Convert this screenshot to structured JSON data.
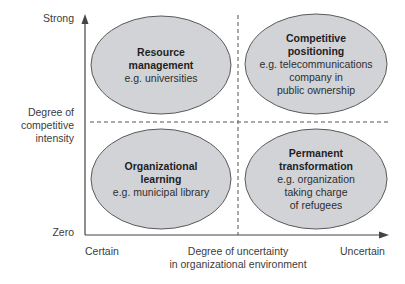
{
  "diagram": {
    "y_axis": {
      "title_lines": [
        "Degree of",
        "competitive",
        "intensity"
      ],
      "top_label": "Strong",
      "bottom_label": "Zero"
    },
    "x_axis": {
      "title_lines": [
        "Degree of uncertainty",
        "in organizational environment"
      ],
      "left_label": "Certain",
      "right_label": "Uncertain"
    },
    "quadrants": [
      {
        "position": "top-left",
        "title_lines": [
          "Resource",
          "management"
        ],
        "example_lines": [
          "e.g. universities"
        ]
      },
      {
        "position": "top-right",
        "title_lines": [
          "Competitive",
          "positioning"
        ],
        "example_lines": [
          "e.g. telecommunications",
          "company in",
          "public ownership"
        ]
      },
      {
        "position": "bottom-left",
        "title_lines": [
          "Organizational",
          "learning"
        ],
        "example_lines": [
          "e.g. municipal library"
        ]
      },
      {
        "position": "bottom-right",
        "title_lines": [
          "Permanent",
          "transformation"
        ],
        "example_lines": [
          "e.g. organization",
          "taking charge",
          "of refugees"
        ]
      }
    ],
    "colors": {
      "ellipse_fill": "#d2d3d6",
      "ellipse_stroke": "#5a5a5a",
      "axis": "#444444",
      "divider": "#555555"
    }
  }
}
